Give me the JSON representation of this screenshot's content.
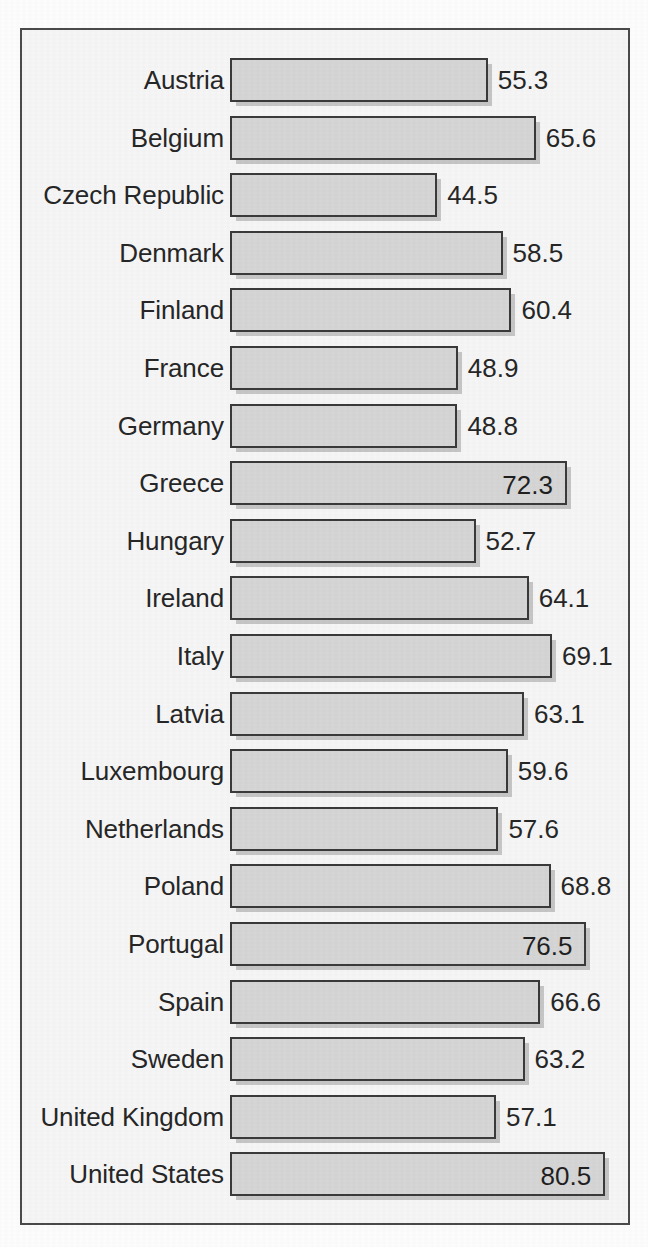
{
  "chart_data": {
    "type": "bar",
    "orientation": "horizontal",
    "title": "",
    "subtitle": "",
    "xlabel": "",
    "ylabel": "",
    "grid": false,
    "legend": null,
    "axis_visible": false,
    "tick_labels": [],
    "xlim": [
      0,
      80.5
    ],
    "value_label_precision": 1,
    "categories": [
      "Austria",
      "Belgium",
      "Czech Republic",
      "Denmark",
      "Finland",
      "France",
      "Germany",
      "Greece",
      "Hungary",
      "Ireland",
      "Italy",
      "Latvia",
      "Luxembourg",
      "Netherlands",
      "Poland",
      "Portugal",
      "Spain",
      "Sweden",
      "United Kingdom",
      "United States"
    ],
    "values": [
      55.3,
      65.6,
      44.5,
      58.5,
      60.4,
      48.9,
      48.8,
      72.3,
      52.7,
      64.1,
      69.1,
      63.1,
      59.6,
      57.6,
      68.8,
      76.5,
      66.6,
      63.2,
      57.1,
      80.5
    ],
    "value_labels": [
      "55.3",
      "65.6",
      "44.5",
      "58.5",
      "60.4",
      "48.9",
      "48.8",
      "72.3",
      "52.7",
      "64.1",
      "69.1",
      "63.1",
      "59.6",
      "57.6",
      "68.8",
      "76.5",
      "66.6",
      "63.2",
      "57.1",
      "80.5"
    ],
    "label_placement": [
      "outside",
      "outside",
      "outside",
      "outside",
      "outside",
      "outside",
      "outside",
      "inside",
      "outside",
      "outside",
      "outside",
      "outside",
      "outside",
      "outside",
      "outside",
      "inside",
      "outside",
      "outside",
      "outside",
      "inside"
    ],
    "colors": {
      "bar_fill": "#d6d6d6",
      "bar_border": "#3a3a3a",
      "bar_shadow": "#9a9a9a",
      "frame_border": "#4a4a4a",
      "plot_background": "#f6f6f6",
      "page_background": "#fdfdfd",
      "text": "#262626"
    }
  }
}
